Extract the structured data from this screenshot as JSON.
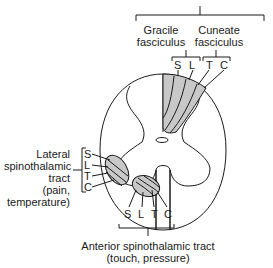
{
  "diagram": {
    "type": "spinal-cord-cross-section",
    "colors": {
      "line": "#1a1a1a",
      "tract_fill": "#c8c8c8",
      "background": "#ffffff"
    },
    "dorsal_columns": {
      "gracile": {
        "line1": "Gracile",
        "line2": "fasciculus",
        "segments": [
          "S",
          "L"
        ]
      },
      "cuneate": {
        "line1": "Cuneate",
        "line2": "fasciculus",
        "segments": [
          "T",
          "C"
        ]
      }
    },
    "lateral_spinothalamic": {
      "line1": "Lateral",
      "line2": "spinothalamic",
      "line3": "tract",
      "line4": "(pain,",
      "line5": "temperature)",
      "segments": [
        "S",
        "L",
        "T",
        "C"
      ]
    },
    "anterior_spinothalamic": {
      "line1": "Anterior spinothalamic tract",
      "line2": "(touch, pressure)",
      "segments": [
        "S",
        "L",
        "T",
        "C"
      ]
    }
  }
}
